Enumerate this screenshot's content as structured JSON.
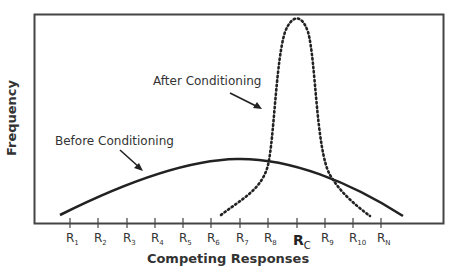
{
  "chart_data": {
    "type": "line",
    "title": "",
    "xlabel": "Competing Responses",
    "ylabel": "Frequency",
    "categories": [
      "R1",
      "R2",
      "R3",
      "R4",
      "R5",
      "R6",
      "R7",
      "R8",
      "RC",
      "R9",
      "R10",
      "RN"
    ],
    "tick_labels": [
      {
        "main": "R",
        "sub": "1"
      },
      {
        "main": "R",
        "sub": "2"
      },
      {
        "main": "R",
        "sub": "3"
      },
      {
        "main": "R",
        "sub": "4"
      },
      {
        "main": "R",
        "sub": "5"
      },
      {
        "main": "R",
        "sub": "6"
      },
      {
        "main": "R",
        "sub": "7"
      },
      {
        "main": "R",
        "sub": "8"
      },
      {
        "main": "R",
        "sub": "C",
        "emphasis": true
      },
      {
        "main": "R",
        "sub": "9"
      },
      {
        "main": "R",
        "sub": "10"
      },
      {
        "main": "R",
        "sub": "N"
      }
    ],
    "series": [
      {
        "name": "Before Conditioning",
        "style": "solid",
        "description": "Broad, flat distribution peaking near R7",
        "values": [
          0.05,
          0.12,
          0.18,
          0.24,
          0.28,
          0.31,
          0.32,
          0.31,
          0.27,
          0.21,
          0.14,
          0.06
        ]
      },
      {
        "name": "After Conditioning",
        "style": "dotted",
        "description": "Sharp, narrow distribution peaking at RC",
        "values": [
          null,
          null,
          null,
          null,
          null,
          0.03,
          0.12,
          0.32,
          1.0,
          0.22,
          0.06,
          null
        ]
      }
    ],
    "annotations": [
      {
        "text": "After Conditioning",
        "points_to": "After Conditioning curve"
      },
      {
        "text": "Before Conditioning",
        "points_to": "Before Conditioning curve"
      }
    ],
    "grid": false,
    "legend": "none (inline annotations with arrows)",
    "ylim": [
      0,
      1.05
    ]
  },
  "labels": {
    "x_axis_title": "Competing Responses",
    "y_axis_title": "Frequency",
    "after": "After Conditioning",
    "before": "Before Conditioning"
  }
}
